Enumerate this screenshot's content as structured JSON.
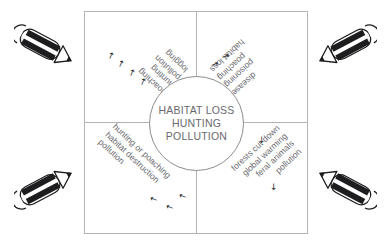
{
  "diagram": {
    "center": {
      "lines": [
        "HABITAT LOSS",
        "HUNTING",
        "POLLUTION"
      ]
    },
    "quadrants": [
      {
        "id": "top-left",
        "orientation": "rotated-180-diagonal",
        "lines": [
          "poaching",
          "hunting",
          "pollution",
          "logging"
        ],
        "arrows": [
          "up-arrow",
          "up-arrow",
          "up-arrow",
          "up-arrow"
        ],
        "arrow_glyph": "↑",
        "arrow_count": 4
      },
      {
        "id": "top-right",
        "orientation": "rotated-180-diagonal",
        "lines": [
          "disease",
          "poisoning",
          "poaching",
          "habitat loss"
        ],
        "arrows": [
          "right-arrow",
          "right-arrow"
        ],
        "arrow_glyph": "→",
        "arrow_count": 2
      },
      {
        "id": "bottom-left",
        "orientation": "diagonal-down-left",
        "lines": [
          "hunting or poaching",
          "habitat destruction",
          "pollution"
        ],
        "arrows": [
          "left-arrow",
          "left-arrow",
          "left-arrow"
        ],
        "arrow_glyph": "←",
        "arrow_count": 3
      },
      {
        "id": "bottom-right",
        "orientation": "diagonal-down-right",
        "lines": [
          "forests cut down",
          "global warming",
          "feral animals",
          "pollution"
        ],
        "arrows": [
          "down-arrow",
          "down-arrow"
        ],
        "arrow_glyph": "↓",
        "arrow_count": 2
      }
    ],
    "corner_objects": [
      {
        "id": "top-left",
        "icon": "pencil-icon",
        "label": "pencil"
      },
      {
        "id": "top-right",
        "icon": "pencil-icon",
        "label": "pencil"
      },
      {
        "id": "bottom-left",
        "icon": "pencil-icon",
        "label": "pencil"
      },
      {
        "id": "bottom-right",
        "icon": "pencil-icon",
        "label": "pencil"
      }
    ],
    "colors": {
      "frame_line": "#b3b3b6",
      "circle_line": "#8d8d91",
      "text": "#6b6b70",
      "center_text": "#69696d",
      "arrow": "#2b2b2e",
      "pencil_body": "#1d1d1f",
      "background": "#ffffff"
    }
  }
}
